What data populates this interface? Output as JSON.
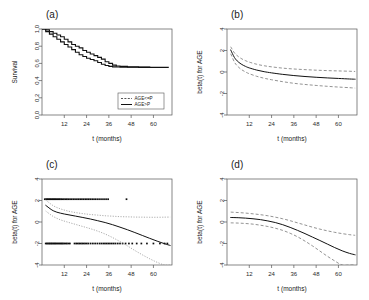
{
  "figure": {
    "panels": [
      {
        "key": "a",
        "label": "(a)",
        "xlabel": "t (months)",
        "ylabel": "Survival"
      },
      {
        "key": "b",
        "label": "(b)",
        "xlabel": "t (months)",
        "ylabel": "beta(t) for AGE"
      },
      {
        "key": "c",
        "label": "(c)",
        "xlabel": "t (months)",
        "ylabel": "beta(t) for AGE"
      },
      {
        "key": "d",
        "label": "(d)",
        "xlabel": "t (months)",
        "ylabel": "beta(t) for AGE"
      }
    ]
  },
  "chart_data": [
    {
      "type": "line",
      "panel": "a",
      "title": "(a)",
      "xlabel": "t (months)",
      "ylabel": "Survival",
      "xlim": [
        0,
        70
      ],
      "ylim": [
        0.0,
        1.0
      ],
      "xticks": [
        12,
        24,
        36,
        48,
        60
      ],
      "yticks": [
        0.0,
        0.2,
        0.4,
        0.6,
        0.8,
        1.0
      ],
      "ytick_labels": [
        "0.0",
        "0.2",
        "0.4",
        "0.6",
        "0.8",
        "1.0"
      ],
      "grid": false,
      "step": true,
      "legend": {
        "position": "bottom-right",
        "entries": [
          {
            "label": "AGE<=P",
            "style": "dashed"
          },
          {
            "label": "AGE>P",
            "style": "solid"
          }
        ]
      },
      "series": [
        {
          "name": "AGE<=P",
          "style": "step-solid",
          "x": [
            0,
            2,
            4,
            6,
            8,
            10,
            12,
            14,
            16,
            18,
            20,
            22,
            24,
            26,
            28,
            30,
            32,
            34,
            36,
            38,
            40,
            42,
            46,
            52,
            58,
            64,
            68
          ],
          "y": [
            1.0,
            0.99,
            0.97,
            0.95,
            0.93,
            0.91,
            0.88,
            0.85,
            0.82,
            0.8,
            0.78,
            0.75,
            0.73,
            0.71,
            0.69,
            0.67,
            0.65,
            0.62,
            0.6,
            0.58,
            0.57,
            0.565,
            0.56,
            0.558,
            0.556,
            0.555,
            0.553
          ]
        },
        {
          "name": "AGE>P",
          "style": "step-solid",
          "x": [
            0,
            2,
            4,
            6,
            8,
            10,
            12,
            14,
            16,
            18,
            20,
            22,
            24,
            26,
            28,
            30,
            32,
            34,
            36,
            38,
            40,
            42,
            46,
            52,
            58,
            64,
            68
          ],
          "y": [
            1.0,
            0.97,
            0.94,
            0.91,
            0.88,
            0.85,
            0.82,
            0.79,
            0.76,
            0.73,
            0.7,
            0.68,
            0.66,
            0.645,
            0.63,
            0.61,
            0.59,
            0.575,
            0.565,
            0.56,
            0.558,
            0.556,
            0.555,
            0.554,
            0.553,
            0.552,
            0.551
          ]
        }
      ]
    },
    {
      "type": "line",
      "panel": "b",
      "title": "(b)",
      "xlabel": "t (months)",
      "ylabel": "beta(t) for AGE",
      "xlim": [
        0,
        70
      ],
      "ylim": [
        -4,
        4
      ],
      "xticks": [
        12,
        24,
        36,
        48,
        60
      ],
      "yticks": [
        -4,
        -2,
        0,
        2,
        4
      ],
      "ytick_labels": [
        "-4",
        "-2",
        "0",
        "2",
        "4"
      ],
      "grid": false,
      "series": [
        {
          "name": "estimate",
          "style": "solid",
          "x": [
            2,
            4,
            6,
            8,
            10,
            12,
            16,
            20,
            24,
            30,
            36,
            42,
            48,
            54,
            60,
            66,
            69
          ],
          "y": [
            2.05,
            1.35,
            0.95,
            0.7,
            0.52,
            0.38,
            0.18,
            0.03,
            -0.08,
            -0.22,
            -0.33,
            -0.42,
            -0.49,
            -0.55,
            -0.6,
            -0.65,
            -0.67
          ]
        },
        {
          "name": "upper-ci",
          "style": "dashed",
          "x": [
            2,
            4,
            6,
            8,
            10,
            12,
            16,
            20,
            24,
            30,
            36,
            42,
            48,
            54,
            60,
            66,
            69
          ],
          "y": [
            2.35,
            1.78,
            1.45,
            1.22,
            1.05,
            0.92,
            0.72,
            0.58,
            0.48,
            0.36,
            0.28,
            0.22,
            0.17,
            0.13,
            0.1,
            0.07,
            0.05
          ]
        },
        {
          "name": "lower-ci",
          "style": "dashed",
          "x": [
            2,
            4,
            6,
            8,
            10,
            12,
            16,
            20,
            24,
            30,
            36,
            42,
            48,
            54,
            60,
            66,
            69
          ],
          "y": [
            1.7,
            0.92,
            0.48,
            0.2,
            0.0,
            -0.16,
            -0.4,
            -0.58,
            -0.72,
            -0.9,
            -1.05,
            -1.16,
            -1.25,
            -1.33,
            -1.4,
            -1.46,
            -1.5
          ]
        }
      ]
    },
    {
      "type": "scatter",
      "panel": "c",
      "title": "(c)",
      "xlabel": "t (months)",
      "ylabel": "beta(t) for AGE",
      "xlim": [
        0,
        70
      ],
      "ylim": [
        -4,
        4
      ],
      "xticks": [
        12,
        24,
        36,
        48,
        60
      ],
      "yticks": [
        -4,
        -2,
        0,
        2,
        4
      ],
      "ytick_labels": [
        "-4",
        "-2",
        "0",
        "2",
        "4"
      ],
      "grid": false,
      "point_clusters": [
        {
          "name": "upper-residual-cluster",
          "y_level": 2.12,
          "x": [
            1.5,
            2.2,
            2.8,
            3.3,
            3.9,
            4.4,
            5.0,
            5.6,
            6.1,
            6.7,
            7.2,
            7.8,
            8.4,
            9.0,
            9.6,
            10.3,
            11.0,
            11.8,
            12.6,
            13.4,
            14.2,
            15.1,
            16.0,
            16.9,
            17.8,
            18.8,
            19.7,
            20.6,
            21.5,
            22.4,
            23.3,
            24.2,
            25.1,
            26.0,
            27.0,
            28.0,
            29.0,
            30.1,
            31.2,
            32.3,
            33.4,
            34.5,
            35.6,
            45.5
          ]
        },
        {
          "name": "lower-residual-cluster",
          "y_level": -2.0,
          "x": [
            2.0,
            2.6,
            3.2,
            3.8,
            4.3,
            4.9,
            5.4,
            6.0,
            6.6,
            7.1,
            7.7,
            8.3,
            8.9,
            9.5,
            10.1,
            10.7,
            11.3,
            12.0,
            12.7,
            13.4,
            14.2,
            15.0,
            17.5,
            18.4,
            19.2,
            20.0,
            20.8,
            21.6,
            22.4,
            23.2,
            24.1,
            25.0,
            26.2,
            27.4,
            28.6,
            29.8,
            31.0,
            32.0,
            33.0,
            33.9,
            34.8,
            35.7,
            36.6,
            37.6,
            38.6,
            39.6,
            40.8,
            42.0,
            43.4,
            45.0,
            46.8,
            48.6,
            51.0,
            53.5,
            56.5,
            60.0,
            63.5,
            66.0,
            67.5
          ]
        }
      ],
      "series": [
        {
          "name": "estimate",
          "style": "solid",
          "x": [
            2,
            6,
            10,
            14,
            18,
            22,
            26,
            30,
            34,
            38,
            42,
            46,
            50,
            54,
            58,
            62,
            66,
            69
          ],
          "y": [
            1.55,
            1.05,
            0.82,
            0.68,
            0.55,
            0.42,
            0.28,
            0.12,
            -0.05,
            -0.25,
            -0.48,
            -0.72,
            -0.98,
            -1.25,
            -1.52,
            -1.78,
            -2.02,
            -2.18
          ]
        },
        {
          "name": "upper-ci",
          "style": "dotted",
          "x": [
            2,
            6,
            10,
            14,
            18,
            22,
            26,
            30,
            34,
            38,
            42,
            46,
            50,
            54,
            58,
            62,
            66,
            69
          ],
          "y": [
            2.05,
            1.52,
            1.22,
            1.02,
            0.88,
            0.78,
            0.7,
            0.64,
            0.58,
            0.54,
            0.5,
            0.48,
            0.46,
            0.45,
            0.44,
            0.44,
            0.45,
            0.46
          ]
        },
        {
          "name": "lower-ci",
          "style": "dotted",
          "x": [
            2,
            6,
            10,
            14,
            18,
            22,
            26,
            30,
            34,
            38,
            42,
            46,
            50,
            54,
            58,
            62,
            66,
            69
          ],
          "y": [
            1.02,
            0.52,
            0.2,
            -0.02,
            -0.22,
            -0.42,
            -0.62,
            -0.85,
            -1.12,
            -1.45,
            -1.82,
            -2.22,
            -2.65,
            -3.05,
            -3.42,
            -3.75,
            -4.0,
            -4.0
          ]
        }
      ]
    },
    {
      "type": "line",
      "panel": "d",
      "title": "(d)",
      "xlabel": "t (months)",
      "ylabel": "beta(t) for AGE",
      "xlim": [
        0,
        70
      ],
      "ylim": [
        -4,
        4
      ],
      "xticks": [
        12,
        24,
        36,
        48,
        60
      ],
      "yticks": [
        -4,
        -2,
        0,
        2,
        4
      ],
      "ytick_labels": [
        "-4",
        "-2",
        "0",
        "2",
        "4"
      ],
      "grid": false,
      "series": [
        {
          "name": "estimate",
          "style": "solid",
          "x": [
            2,
            6,
            10,
            14,
            18,
            22,
            26,
            30,
            34,
            38,
            42,
            46,
            50,
            54,
            58,
            62,
            66,
            69
          ],
          "y": [
            0.42,
            0.4,
            0.36,
            0.3,
            0.22,
            0.1,
            -0.05,
            -0.25,
            -0.5,
            -0.78,
            -1.08,
            -1.4,
            -1.72,
            -2.05,
            -2.38,
            -2.68,
            -2.92,
            -3.05
          ]
        },
        {
          "name": "upper-ci",
          "style": "dashed",
          "x": [
            2,
            6,
            10,
            14,
            18,
            22,
            26,
            30,
            34,
            38,
            42,
            46,
            50,
            54,
            58,
            62,
            66,
            69
          ],
          "y": [
            0.92,
            0.88,
            0.83,
            0.76,
            0.68,
            0.58,
            0.45,
            0.3,
            0.12,
            -0.08,
            -0.28,
            -0.48,
            -0.66,
            -0.82,
            -0.96,
            -1.08,
            -1.18,
            -1.24
          ]
        },
        {
          "name": "lower-ci",
          "style": "dashed",
          "x": [
            2,
            6,
            10,
            14,
            18,
            22,
            26,
            30,
            34,
            38,
            42,
            46,
            50,
            54,
            58,
            62,
            66,
            69
          ],
          "y": [
            -0.08,
            -0.1,
            -0.14,
            -0.2,
            -0.3,
            -0.42,
            -0.58,
            -0.78,
            -1.05,
            -1.38,
            -1.78,
            -2.22,
            -2.7,
            -3.18,
            -3.62,
            -4.0,
            -4.0,
            -4.0
          ]
        }
      ]
    }
  ]
}
